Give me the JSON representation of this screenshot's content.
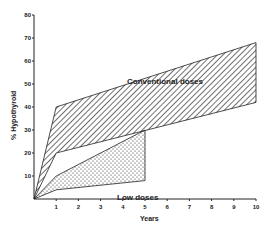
{
  "chart_data": {
    "type": "area",
    "title": "",
    "xlabel": "Years",
    "ylabel": "% Hypothyroid",
    "xlim": [
      0,
      10
    ],
    "ylim": [
      0,
      80
    ],
    "x_ticks": [
      1,
      2,
      3,
      4,
      5,
      6,
      7,
      8,
      9,
      10
    ],
    "y_ticks": [
      10,
      20,
      30,
      40,
      50,
      60,
      70,
      80
    ],
    "grid": false,
    "legend": "none (inline labels)",
    "series": [
      {
        "name": "Conventional doses",
        "fill": "diagonal-hatch",
        "x": [
          0,
          1,
          10
        ],
        "upper": [
          0,
          40,
          68
        ],
        "lower": [
          0,
          20,
          42
        ]
      },
      {
        "name": "Low doses",
        "fill": "stipple",
        "x": [
          0,
          1,
          5
        ],
        "upper": [
          0,
          10,
          30
        ],
        "lower": [
          0,
          4,
          8
        ]
      }
    ],
    "annotations": [
      {
        "text": "Conventional doses",
        "x": 4.6,
        "y": 57
      },
      {
        "text": "Low doses",
        "x": 4.5,
        "y": 4
      }
    ]
  },
  "labels": {
    "conventional": "Conventional  doses",
    "low": "Low  doses",
    "xlabel": "Years",
    "ylabel": "% Hypothyroid"
  }
}
